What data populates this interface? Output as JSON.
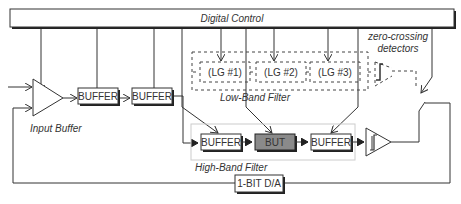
{
  "diagram": {
    "control_bar": {
      "label": "Digital Control"
    },
    "input_buffer": {
      "label": "Input Buffer"
    },
    "buffers": [
      {
        "label": "BUFFER"
      },
      {
        "label": "BUFFER"
      }
    ],
    "low_band": {
      "label": "Low-Band Filter",
      "stages": [
        {
          "label": "(LG #1)"
        },
        {
          "label": "(LG #2)"
        },
        {
          "label": "(LG #3)"
        }
      ]
    },
    "zero_crossing": {
      "label_line1": "zero-crossing",
      "label_line2": "detectors"
    },
    "high_band": {
      "label": "High-Band Filter",
      "stages": [
        {
          "label": "BUFFER"
        },
        {
          "label": "BUT"
        },
        {
          "label": "BUFFER"
        }
      ]
    },
    "dac": {
      "label": "1-BIT D/A"
    },
    "colors": {
      "line": "#333333",
      "but_fill": "#8a8a8a",
      "shadow": "#222222",
      "hb_border": "#cccccc"
    }
  }
}
